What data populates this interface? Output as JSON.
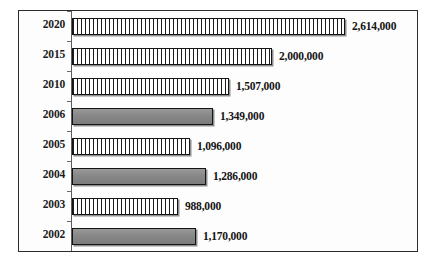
{
  "chart_data": {
    "type": "bar",
    "orientation": "horizontal",
    "title": "",
    "subtitle": "",
    "xlabel": "",
    "ylabel": "",
    "grid": false,
    "legend": null,
    "axis": {
      "category_axis": "vertical-left",
      "value_axis_visible": false,
      "tick_labels_visible_on_value_axis": false
    },
    "categories": [
      "2020",
      "2015",
      "2010",
      "2006",
      "2005",
      "2004",
      "2003",
      "2002"
    ],
    "values": [
      2614000,
      2000000,
      1507000,
      1349000,
      1096000,
      1286000,
      988000,
      1170000
    ],
    "value_labels": [
      "2,614,000",
      "2,000,000",
      "1,507,000",
      "1,349,000",
      "1,096,000",
      "1,286,000",
      "988,000",
      "1,170,000"
    ],
    "bar_pixel_lengths": [
      273,
      200,
      157,
      141,
      118,
      134,
      106,
      124
    ],
    "bar_fill_styles": [
      "grid",
      "grid",
      "grid",
      "solid",
      "grid",
      "solid",
      "grid",
      "solid"
    ],
    "colors": {
      "grid_fill_ink": "#1c1c1c",
      "grid_fill_background": "#ffffff",
      "solid_fill": "#8a8a8a",
      "bar_outline": "#141414",
      "bar_shadow": "#8f8f8f",
      "frame": "#2b2b2b",
      "axis": "#5d5d5d",
      "text": "#141414",
      "background": "#ffffff"
    },
    "rows": [
      {
        "category": "2020",
        "value": 2614000,
        "label": "2,614,000",
        "bar_px": 273,
        "fill": "grid"
      },
      {
        "category": "2015",
        "value": 2000000,
        "label": "2,000,000",
        "bar_px": 200,
        "fill": "grid"
      },
      {
        "category": "2010",
        "value": 1507000,
        "label": "1,507,000",
        "bar_px": 157,
        "fill": "grid"
      },
      {
        "category": "2006",
        "value": 1349000,
        "label": "1,349,000",
        "bar_px": 141,
        "fill": "solid"
      },
      {
        "category": "2005",
        "value": 1096000,
        "label": "1,096,000",
        "bar_px": 118,
        "fill": "grid"
      },
      {
        "category": "2004",
        "value": 1286000,
        "label": "1,286,000",
        "bar_px": 134,
        "fill": "solid"
      },
      {
        "category": "2003",
        "value": 988000,
        "label": "988,000",
        "bar_px": 106,
        "fill": "grid"
      },
      {
        "category": "2002",
        "value": 1170000,
        "label": "1,170,000",
        "bar_px": 124,
        "fill": "solid"
      }
    ]
  }
}
